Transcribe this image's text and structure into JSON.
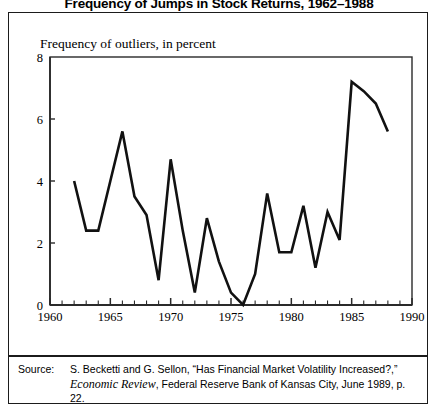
{
  "figure": {
    "title": "Frequency of Jumps in Stock Returns, 1962–1988",
    "axis_caption": "Frequency of outliers, in percent"
  },
  "source": {
    "label": "Source:",
    "text_part1": "S. Becketti and G. Sellon, “Has Financial Market Volatility Increased?,” ",
    "italic": "Economic Review",
    "text_part2": ", Federal Reserve Bank of Kansas City, June 1989, p. 22."
  },
  "chart_data": {
    "type": "line",
    "title": "Frequency of Jumps in Stock Returns, 1962–1988",
    "subtitle": "",
    "xlabel": "",
    "ylabel": "Frequency of outliers, in percent",
    "xlim": [
      1960,
      1990
    ],
    "ylim": [
      0,
      8
    ],
    "xticks": [
      1960,
      1965,
      1970,
      1975,
      1980,
      1985,
      1990
    ],
    "xtick_labels": [
      "1960",
      "1965",
      "1970",
      "1975",
      "1980",
      "1985",
      "1990"
    ],
    "xminor_tick_step": 1,
    "yticks": [
      0,
      2,
      4,
      6,
      8
    ],
    "ytick_labels": [
      "0",
      "2",
      "4",
      "6",
      "8"
    ],
    "grid": false,
    "legend": "none",
    "line_color": "#111111",
    "line_width": 2.6,
    "x": [
      1962,
      1963,
      1964,
      1965,
      1966,
      1967,
      1968,
      1969,
      1970,
      1971,
      1972,
      1973,
      1974,
      1975,
      1976,
      1977,
      1978,
      1979,
      1980,
      1981,
      1982,
      1983,
      1984,
      1985,
      1986,
      1987,
      1988
    ],
    "values": [
      4.0,
      2.4,
      2.4,
      4.0,
      5.6,
      3.5,
      2.9,
      0.8,
      4.7,
      2.4,
      0.4,
      2.8,
      1.4,
      0.4,
      0.0,
      1.0,
      3.6,
      1.7,
      1.7,
      3.2,
      1.2,
      3.0,
      2.1,
      7.2,
      6.9,
      6.5,
      5.6
    ],
    "series": [
      {
        "name": "Frequency of outliers",
        "values": [
          4.0,
          2.4,
          2.4,
          4.0,
          5.6,
          3.5,
          2.9,
          0.8,
          4.7,
          2.4,
          0.4,
          2.8,
          1.4,
          0.4,
          0.0,
          1.0,
          3.6,
          1.7,
          1.7,
          3.2,
          1.2,
          3.0,
          2.1,
          7.2,
          6.9,
          6.5,
          5.6
        ]
      }
    ]
  }
}
